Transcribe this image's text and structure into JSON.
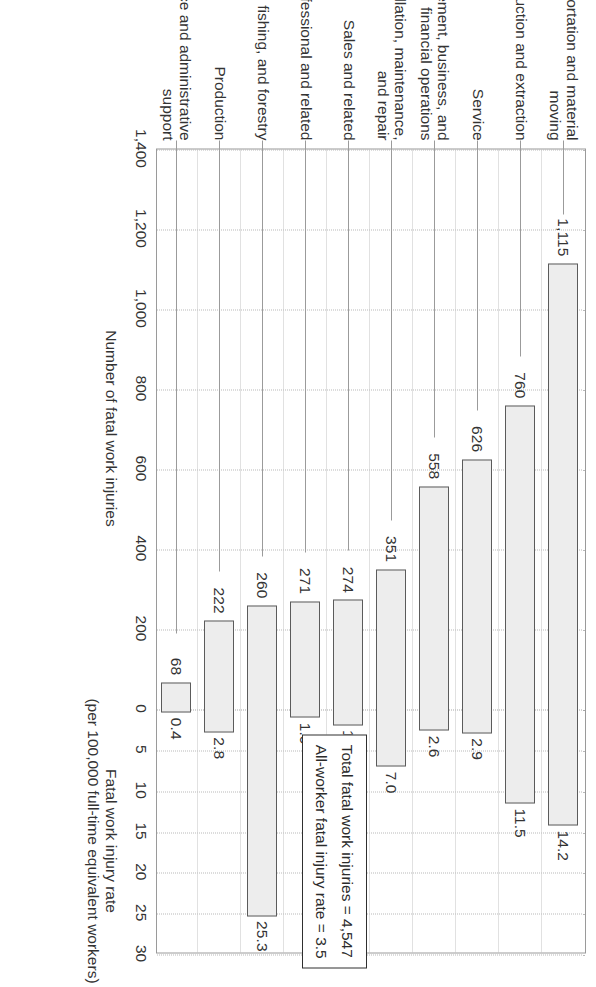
{
  "chart_data": {
    "type": "bar",
    "title": "",
    "orientation": "rotated-90",
    "categories": [
      "Transportation and material moving",
      "Construction and extraction",
      "Service",
      "Management, business, and financial operations",
      "Installation, maintenance, and repair",
      "Sales and related",
      "Professional and related",
      "Farming, fishing, and forestry",
      "Production",
      "Office and administrative support"
    ],
    "category_lines": [
      [
        "Transportation and material",
        "moving"
      ],
      [
        "Construction and extraction"
      ],
      [
        "Service"
      ],
      [
        "Management, business, and",
        "financial operations"
      ],
      [
        "Installation, maintenance,",
        "and repair"
      ],
      [
        "Sales and related"
      ],
      [
        "Professional and related"
      ],
      [
        "Farming, fishing, and forestry"
      ],
      [
        "Production"
      ],
      [
        "Office and administrative",
        "support"
      ]
    ],
    "series": [
      {
        "name": "Number of fatal work injuries",
        "axis": "left",
        "values": [
          1115,
          760,
          626,
          558,
          351,
          274,
          271,
          260,
          222,
          68
        ],
        "labels": [
          "1,115",
          "760",
          "626",
          "558",
          "351",
          "274",
          "271",
          "260",
          "222",
          "68"
        ]
      },
      {
        "name": "Fatal work injury rate",
        "axis": "right",
        "values": [
          14.2,
          11.5,
          2.9,
          2.6,
          7.0,
          1.9,
          1.0,
          25.3,
          2.8,
          0.4
        ],
        "labels": [
          "14.2",
          "11.5",
          "2.9",
          "2.6",
          "7.0",
          "1.9",
          "1.0",
          "25.3",
          "2.8",
          "0.4"
        ]
      }
    ],
    "left_axis": {
      "label_line1": "Number of fatal work injuries",
      "ticks": [
        "1,400",
        "1,200",
        "1,000",
        "800",
        "600",
        "400",
        "200",
        "0"
      ],
      "tick_values": [
        1400,
        1200,
        1000,
        800,
        600,
        400,
        200,
        0
      ],
      "max": 1400,
      "min": 0,
      "reversed": true
    },
    "right_axis": {
      "label_line1": "Fatal work injury rate",
      "label_line2": "(per 100,000 full-time equivalent workers)",
      "ticks": [
        "0",
        "5",
        "10",
        "15",
        "20",
        "25",
        "30"
      ],
      "tick_values": [
        0,
        5,
        10,
        15,
        20,
        25,
        30
      ],
      "max": 30,
      "min": 0
    },
    "annotation": {
      "line1": "Total fatal work injuries = 4,547",
      "line2": "All-worker fatal injury rate = 3.5"
    },
    "grid": true,
    "legend": "none",
    "colors": {
      "bar_fill": "#ededed",
      "bar_stroke": "#5b5b5b",
      "grid": "#c4c4c4",
      "text": "#333333",
      "callout_border": "#2f2f2f"
    }
  }
}
